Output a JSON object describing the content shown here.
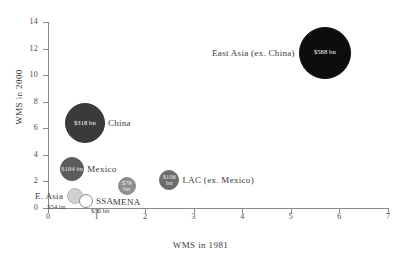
{
  "chart_data": {
    "type": "scatter",
    "title": "",
    "xlabel": "WMS in 1981",
    "ylabel": "WMS in 2000",
    "xlim": [
      0,
      7
    ],
    "ylim": [
      0,
      14
    ],
    "xticks": [
      "0",
      "1",
      "2",
      "3",
      "4",
      "5",
      "6",
      "7"
    ],
    "yticks": [
      "0",
      "2",
      "4",
      "6",
      "8",
      "10",
      "12",
      "14"
    ],
    "grid": false,
    "legend": "none",
    "bubble_size_encodes": "value",
    "points": [
      {
        "name": "East Asia (ex. China)",
        "label": "East Asia (ex. China)",
        "value_text": "$588 bn",
        "value": 588,
        "x": 5.7,
        "y": 11.7,
        "radius_px": 26,
        "fill": "#0d0d0d",
        "stroke": "#0d0d0d",
        "value_color": "#ffffff",
        "label_position": "left",
        "value_inside": true
      },
      {
        "name": "China",
        "label": "China",
        "value_text": "$318 bn",
        "value": 318,
        "x": 0.76,
        "y": 6.4,
        "radius_px": 20,
        "fill": "#3a3a3a",
        "stroke": "#3a3a3a",
        "value_color": "#ffffff",
        "label_position": "right",
        "value_inside": true
      },
      {
        "name": "Mexico",
        "label": "Mexico",
        "value_text": "$184 bn",
        "value": 184,
        "x": 0.5,
        "y": 2.9,
        "radius_px": 12,
        "fill": "#5e5c5a",
        "stroke": "#5e5c5a",
        "value_color": "#e8e6e4",
        "label_position": "right",
        "value_inside": true
      },
      {
        "name": "LAC (ex. Mexico)",
        "label": "LAC (ex. Mexico)",
        "value_text": "$106\nbn",
        "value": 106,
        "x": 2.5,
        "y": 2.1,
        "radius_px": 10,
        "fill": "#6e6c6a",
        "stroke": "#6e6c6a",
        "value_color": "#eceaE8",
        "label_position": "right",
        "value_inside": true
      },
      {
        "name": "MENA",
        "label": "MENA",
        "value_text": "$79\nbn",
        "value": 79,
        "x": 1.62,
        "y": 1.62,
        "radius_px": 9,
        "fill": "#908e8c",
        "stroke": "#908e8c",
        "value_color": "#f4f2f0",
        "label_position": "below",
        "value_inside": true
      },
      {
        "name": "E. Asia",
        "label": "E. Asia",
        "value_text": "$54 bn",
        "value": 54,
        "x": 0.56,
        "y": 0.88,
        "radius_px": 8,
        "fill": "#d2d0ce",
        "stroke": "#b8b6b4",
        "value_color": "#3c3a38",
        "label_position": "left",
        "value_inside": false,
        "value_offset": "below-left"
      },
      {
        "name": "SSA",
        "label": "SSA",
        "value_text": "$30 bn",
        "value": 30,
        "x": 0.78,
        "y": 0.5,
        "radius_px": 7,
        "fill": "#ffffff",
        "stroke": "#8c8a88",
        "value_color": "#3c3a38",
        "label_position": "right",
        "value_inside": false,
        "value_offset": "below-right"
      }
    ]
  }
}
